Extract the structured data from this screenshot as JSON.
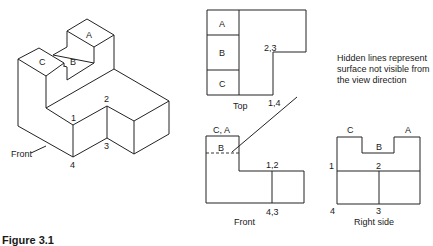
{
  "figure": {
    "caption": "Figure 3.1",
    "isometric": {
      "labels": {
        "a": "A",
        "b": "B",
        "c": "C",
        "p1": "1",
        "p2": "2",
        "p3": "3",
        "p4": "4",
        "front": "Front"
      }
    },
    "top_view": {
      "title": "Top",
      "cells": [
        "A",
        "B",
        "C"
      ],
      "label_23": "2,3",
      "label_14": "1,4"
    },
    "front_view": {
      "title": "Front",
      "label_ca": "C, A",
      "label_b": "B",
      "label_12": "1,2",
      "label_43": "4,3"
    },
    "right_view": {
      "title": "Right side",
      "label_c": "C",
      "label_a": "A",
      "label_b": "B",
      "label_1": "1",
      "label_2": "2",
      "label_3": "3",
      "label_4": "4"
    },
    "annotation": {
      "text": "Hidden lines represent surface not visible from the view direction"
    }
  }
}
